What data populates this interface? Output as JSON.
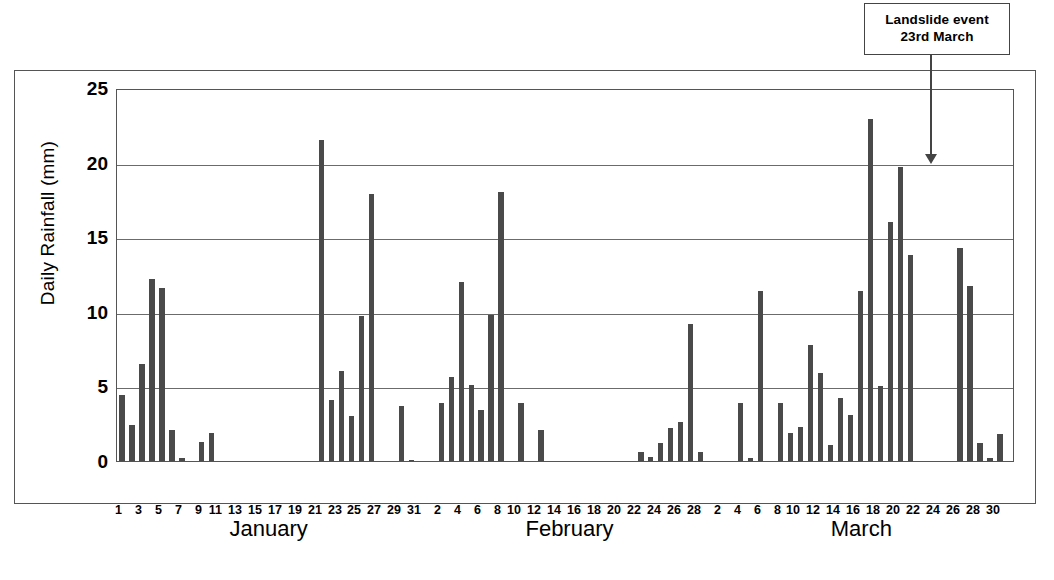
{
  "annotation": {
    "line1": "Landslide event",
    "line2": "23rd March",
    "arrow": "down-arrow-icon"
  },
  "axes": {
    "ylabel": "Daily Rainfall (mm)",
    "yticks": [
      0,
      5,
      10,
      15,
      20,
      25
    ],
    "ylim": [
      0,
      25
    ],
    "xlabel": ""
  },
  "months": [
    {
      "name": "January",
      "center_pct": 17.0
    },
    {
      "name": "February",
      "center_pct": 50.5
    },
    {
      "name": "March",
      "center_pct": 83.0
    }
  ],
  "colors": {
    "bar": "#4a4a4a",
    "grid": "#6b6b6b",
    "frame": "#555555",
    "background": "#ffffff"
  },
  "chart_data": {
    "type": "bar",
    "title": "",
    "xlabel": "",
    "ylabel": "Daily Rainfall (mm)",
    "ylim": [
      0,
      25
    ],
    "yticks": [
      0,
      5,
      10,
      15,
      20,
      25
    ],
    "grid": true,
    "legend": null,
    "annotations": [
      {
        "text": "Landslide event 23rd March",
        "points_to": "23 March",
        "style": "boxed-label-with-arrow"
      }
    ],
    "tick_label_rule": "January: odd days 1-31; February: even days 2-28; March: even days 2-30",
    "categories": [
      "1 Jan",
      "2 Jan",
      "3 Jan",
      "4 Jan",
      "5 Jan",
      "6 Jan",
      "7 Jan",
      "8 Jan",
      "9 Jan",
      "10 Jan",
      "11 Jan",
      "12 Jan",
      "13 Jan",
      "14 Jan",
      "15 Jan",
      "16 Jan",
      "17 Jan",
      "18 Jan",
      "19 Jan",
      "20 Jan",
      "21 Jan",
      "22 Jan",
      "23 Jan",
      "24 Jan",
      "25 Jan",
      "26 Jan",
      "27 Jan",
      "28 Jan",
      "29 Jan",
      "30 Jan",
      "31 Jan",
      "1 Feb",
      "2 Feb",
      "3 Feb",
      "4 Feb",
      "5 Feb",
      "6 Feb",
      "7 Feb",
      "8 Feb",
      "9 Feb",
      "10 Feb",
      "11 Feb",
      "12 Feb",
      "13 Feb",
      "14 Feb",
      "15 Feb",
      "16 Feb",
      "17 Feb",
      "18 Feb",
      "19 Feb",
      "20 Feb",
      "21 Feb",
      "22 Feb",
      "23 Feb",
      "24 Feb",
      "25 Feb",
      "26 Feb",
      "27 Feb",
      "28 Feb",
      "1 Mar",
      "2 Mar",
      "3 Mar",
      "4 Mar",
      "5 Mar",
      "6 Mar",
      "7 Mar",
      "8 Mar",
      "9 Mar",
      "10 Mar",
      "11 Mar",
      "12 Mar",
      "13 Mar",
      "14 Mar",
      "15 Mar",
      "16 Mar",
      "17 Mar",
      "18 Mar",
      "19 Mar",
      "20 Mar",
      "21 Mar",
      "22 Mar",
      "23 Mar",
      "24 Mar",
      "25 Mar",
      "26 Mar",
      "27 Mar",
      "28 Mar",
      "29 Mar",
      "30 Mar",
      "31 Mar"
    ],
    "values": [
      4.4,
      2.4,
      6.5,
      12.2,
      11.6,
      2.1,
      0.2,
      0,
      1.3,
      1.9,
      0,
      0,
      0,
      0,
      0,
      0,
      0,
      0,
      0,
      0,
      21.5,
      4.1,
      6.0,
      3.0,
      9.7,
      17.9,
      0,
      0,
      3.7,
      0.1,
      0,
      0,
      3.9,
      5.6,
      12.0,
      5.1,
      3.4,
      9.8,
      18.0,
      0,
      3.9,
      0,
      2.1,
      0,
      0,
      0,
      0,
      0,
      0,
      0,
      0,
      0,
      0.6,
      0.3,
      1.2,
      2.2,
      2.6,
      9.2,
      0.6,
      0,
      0,
      0,
      3.9,
      0.2,
      11.4,
      0,
      3.9,
      1.9,
      2.3,
      7.8,
      5.9,
      1.1,
      4.2,
      3.1,
      11.4,
      22.9,
      5.0,
      16.0,
      19.7,
      13.8,
      0,
      0,
      0,
      0,
      14.3,
      11.7,
      1.2,
      0.2,
      1.8,
      0
    ],
    "xtick_labels": [
      "1",
      "",
      "3",
      "",
      "5",
      "",
      "7",
      "",
      "9",
      "",
      "11",
      "",
      "13",
      "",
      "15",
      "",
      "17",
      "",
      "19",
      "",
      "21",
      "",
      "23",
      "",
      "25",
      "",
      "27",
      "",
      "29",
      "",
      "31",
      "",
      "2",
      "",
      "4",
      "",
      "6",
      "",
      "8",
      "",
      "10",
      "",
      "12",
      "",
      "14",
      "",
      "16",
      "",
      "18",
      "",
      "20",
      "",
      "22",
      "",
      "24",
      "",
      "26",
      "",
      "28",
      "",
      "2",
      "",
      "4",
      "",
      "6",
      "",
      "8",
      "",
      "10",
      "",
      "12",
      "",
      "14",
      "",
      "16",
      "",
      "18",
      "",
      "20",
      "",
      "22",
      "",
      "24",
      "",
      "26",
      "",
      "28",
      "",
      "30",
      ""
    ]
  }
}
